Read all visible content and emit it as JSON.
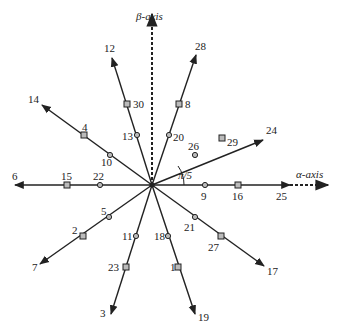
{
  "diagram": {
    "title": "",
    "center": [
      152,
      185
    ],
    "axes": {
      "alpha": {
        "label": "α-axis",
        "label_pos": [
          252,
          178
        ]
      },
      "beta": {
        "label": "β-axis",
        "label_pos": [
          136,
          20
        ]
      }
    },
    "angle_annotation": {
      "label": "π/5",
      "pos": [
        178,
        179
      ]
    },
    "rays": [
      {
        "angle_deg": 0,
        "end": [
          290,
          185
        ],
        "end_label": "25",
        "end_label_pos": [
          276,
          200
        ],
        "markers": [
          {
            "label": "9",
            "shape": "circle",
            "pos": [
              205,
              185
            ],
            "label_pos": [
              201,
              200
            ]
          },
          {
            "label": "16",
            "shape": "square",
            "pos": [
              238,
              185
            ],
            "label_pos": [
              232,
              200
            ]
          }
        ]
      },
      {
        "angle_deg": 36,
        "end": [
          263,
          140
        ],
        "end_label": "24",
        "end_label_pos": [
          266,
          134
        ],
        "markers": [
          {
            "label": "26",
            "shape": "circle",
            "pos": [
              195,
              155
            ],
            "label_pos": [
              188,
              150
            ]
          },
          {
            "label": "29",
            "shape": "square",
            "pos": [
              222,
              138
            ],
            "label_pos": [
              227,
              146
            ]
          }
        ]
      },
      {
        "angle_deg": 72,
        "end": [
          196,
          55
        ],
        "end_label": "28",
        "end_label_pos": [
          195,
          50
        ],
        "markers": [
          {
            "label": "20",
            "shape": "circle",
            "pos": [
              169,
              135
            ],
            "label_pos": [
              173,
              141
            ]
          },
          {
            "label": "8",
            "shape": "square",
            "pos": [
              179,
              104
            ],
            "label_pos": [
              185,
              108
            ]
          }
        ]
      },
      {
        "angle_deg": 108,
        "end": [
          112,
          58
        ],
        "end_label": "12",
        "end_label_pos": [
          104,
          52
        ],
        "markers": [
          {
            "label": "13",
            "shape": "circle",
            "pos": [
              137,
              135
            ],
            "label_pos": [
              122,
              140
            ]
          },
          {
            "label": "30",
            "shape": "square",
            "pos": [
              127,
              104
            ],
            "label_pos": [
              133,
              108
            ]
          }
        ]
      },
      {
        "angle_deg": 144,
        "end": [
          42,
          105
        ],
        "end_label": "14",
        "end_label_pos": [
          28,
          103
        ],
        "markers": [
          {
            "label": "10",
            "shape": "circle",
            "pos": [
              110,
              155
            ],
            "label_pos": [
              101,
              166
            ]
          },
          {
            "label": "4",
            "shape": "square",
            "pos": [
              84,
              135
            ],
            "label_pos": [
              82,
              131
            ]
          }
        ]
      },
      {
        "angle_deg": 180,
        "end": [
          15,
          185
        ],
        "end_label": "6",
        "end_label_pos": [
          12,
          180
        ],
        "markers": [
          {
            "label": "22",
            "shape": "circle",
            "pos": [
              100,
              185
            ],
            "label_pos": [
              93,
              180
            ]
          },
          {
            "label": "15",
            "shape": "square",
            "pos": [
              67,
              185
            ],
            "label_pos": [
              61,
              180
            ]
          }
        ]
      },
      {
        "angle_deg": 216,
        "end": [
          40,
          264
        ],
        "end_label": "7",
        "end_label_pos": [
          32,
          271
        ],
        "markers": [
          {
            "label": "5",
            "shape": "circle",
            "pos": [
              109,
              217
            ],
            "label_pos": [
              101,
              215
            ]
          },
          {
            "label": "2",
            "shape": "square",
            "pos": [
              83,
              236
            ],
            "label_pos": [
              72,
              234
            ]
          }
        ]
      },
      {
        "angle_deg": 252,
        "end": [
          111,
          314
        ],
        "end_label": "3",
        "end_label_pos": [
          100,
          317
        ],
        "markers": [
          {
            "label": "11",
            "shape": "circle",
            "pos": [
              136,
              236
            ],
            "label_pos": [
              122,
              240
            ]
          },
          {
            "label": "23",
            "shape": "square",
            "pos": [
              126,
              267
            ],
            "label_pos": [
              108,
              271
            ]
          }
        ]
      },
      {
        "angle_deg": 288,
        "end": [
          195,
          314
        ],
        "end_label": "19",
        "end_label_pos": [
          198,
          321
        ],
        "markers": [
          {
            "label": "18",
            "shape": "circle",
            "pos": [
              168,
              236
            ],
            "label_pos": [
              154,
              240
            ]
          },
          {
            "label": "1",
            "shape": "square",
            "pos": [
              178,
              267
            ],
            "label_pos": [
              170,
              271
            ]
          }
        ]
      },
      {
        "angle_deg": 324,
        "end": [
          264,
          266
        ],
        "end_label": "17",
        "end_label_pos": [
          267,
          275
        ],
        "markers": [
          {
            "label": "21",
            "shape": "circle",
            "pos": [
              195,
              217
            ],
            "label_pos": [
              184,
              231
            ]
          },
          {
            "label": "27",
            "shape": "square",
            "pos": [
              221,
              236
            ],
            "label_pos": [
              208,
              251
            ]
          }
        ]
      }
    ]
  }
}
